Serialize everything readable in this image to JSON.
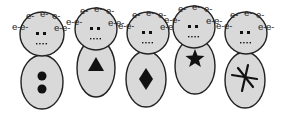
{
  "figure": {
    "electron_label": "e-",
    "figures": [
      {
        "id": "figure-1",
        "body_symbol": "two-dots",
        "head_labels": [
          "e-",
          "e-",
          "e-",
          "e-",
          "e-",
          "e-",
          "e-"
        ]
      },
      {
        "id": "figure-2",
        "body_symbol": "triangle",
        "head_labels": [
          "e-",
          "e-",
          "e-",
          "e-",
          "e-",
          "e-",
          "e-"
        ]
      },
      {
        "id": "figure-3",
        "body_symbol": "diamond",
        "head_labels": [
          "e-",
          "e-",
          "e-",
          "e-",
          "e-",
          "e-",
          "e-"
        ]
      },
      {
        "id": "figure-4",
        "body_symbol": "star",
        "head_labels": [
          "e-",
          "e-",
          "e-",
          "e-",
          "e-",
          "e-",
          "e-"
        ]
      },
      {
        "id": "figure-5",
        "body_symbol": "asterisk",
        "head_labels": [
          "e-",
          "e-",
          "e-",
          "e-",
          "e-",
          "e-",
          "e-"
        ]
      }
    ]
  },
  "colors": {
    "fill": "#d9d9d9",
    "outline": "#222222",
    "symbol": "#111111"
  }
}
